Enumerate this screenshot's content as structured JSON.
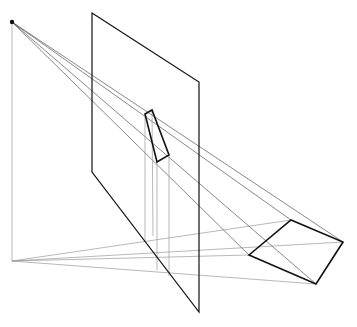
{
  "diagram": {
    "title": "",
    "eye": [
      12,
      22
    ],
    "ground_point": [
      12,
      261
    ],
    "picture_plane": [
      [
        92,
        13
      ],
      [
        199,
        82
      ],
      [
        199,
        312
      ],
      [
        92,
        172
      ]
    ],
    "object_quad": [
      [
        249,
        255
      ],
      [
        291,
        220
      ],
      [
        343,
        242
      ],
      [
        316,
        284
      ]
    ],
    "projected_quad": [
      [
        145,
        114
      ],
      [
        152,
        110
      ],
      [
        169,
        155
      ],
      [
        157,
        162
      ]
    ],
    "projector_verticals": [
      [
        145,
        114,
        145,
        242
      ],
      [
        152,
        110,
        153,
        236
      ],
      [
        157,
        162,
        157,
        270
      ],
      [
        169,
        155,
        169,
        276
      ]
    ],
    "colors": {
      "bold": "#111111",
      "thin": "#9a9a9a",
      "ray": "#555555"
    }
  }
}
